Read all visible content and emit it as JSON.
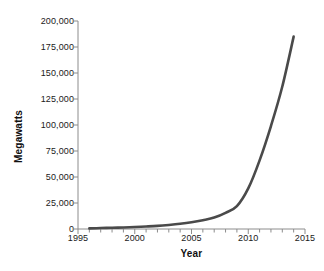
{
  "chart_data": {
    "type": "line",
    "title": "",
    "xlabel": "Year",
    "ylabel": "Megawatts",
    "xlim": [
      1995,
      2015
    ],
    "ylim": [
      0,
      200000
    ],
    "grid": false,
    "legend": "none",
    "x_ticks": [
      1995,
      2000,
      2005,
      2010,
      2015
    ],
    "x_tick_labels": [
      "1995",
      "2000",
      "2005",
      "2010",
      "2015"
    ],
    "x_minor_tick_step": 1,
    "y_ticks": [
      0,
      25000,
      50000,
      75000,
      100000,
      125000,
      150000,
      175000,
      200000
    ],
    "y_tick_labels": [
      "0",
      "25,000",
      "50,000",
      "75,000",
      "100,000",
      "125,000",
      "150,000",
      "175,000",
      "200,000"
    ],
    "series": [
      {
        "name": "Installed capacity",
        "color": "#4a4a4a",
        "line_width": 2.6,
        "x": [
          1996,
          1997,
          1998,
          1999,
          2000,
          2001,
          2002,
          2003,
          2004,
          2005,
          2006,
          2007,
          2008,
          2009,
          2010,
          2011,
          2012,
          2013,
          2014
        ],
        "values": [
          600,
          900,
          1200,
          1500,
          1900,
          2400,
          3000,
          3900,
          5000,
          6500,
          8500,
          11000,
          15500,
          22000,
          39000,
          66000,
          99000,
          137000,
          185000
        ]
      }
    ]
  },
  "axes": {
    "y_title": "Megawatts",
    "x_title": "Year"
  }
}
